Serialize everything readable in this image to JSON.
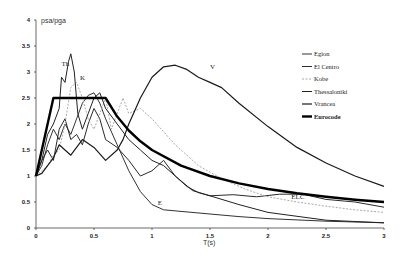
{
  "chart_data": {
    "type": "line",
    "title": "",
    "xlabel": "T(s)",
    "ylabel": "psa/pga",
    "xlim": [
      0,
      3
    ],
    "ylim": [
      0,
      4
    ],
    "x_ticks": [
      "0",
      "0.5",
      "1",
      "1.5",
      "2",
      "2.5",
      "3"
    ],
    "y_ticks": [
      "0",
      "0.5",
      "1",
      "1.5",
      "2",
      "2.5",
      "3",
      "3.5",
      "4"
    ],
    "grid": false,
    "legend_position": "upper right",
    "series": [
      {
        "name": "Egion",
        "label": "E",
        "color": "#333333",
        "width": 1,
        "dash": "",
        "points": [
          [
            0,
            1
          ],
          [
            0.05,
            1.2
          ],
          [
            0.1,
            1.6
          ],
          [
            0.15,
            1.9
          ],
          [
            0.2,
            1.7
          ],
          [
            0.25,
            2.0
          ],
          [
            0.3,
            1.8
          ],
          [
            0.35,
            2.1
          ],
          [
            0.4,
            2.4
          ],
          [
            0.45,
            2.55
          ],
          [
            0.5,
            2.6
          ],
          [
            0.55,
            2.4
          ],
          [
            0.6,
            2.1
          ],
          [
            0.7,
            1.6
          ],
          [
            0.8,
            1.1
          ],
          [
            0.9,
            0.7
          ],
          [
            1.0,
            0.45
          ],
          [
            1.1,
            0.35
          ],
          [
            1.25,
            0.32
          ],
          [
            1.5,
            0.27
          ],
          [
            1.75,
            0.22
          ],
          [
            2.0,
            0.18
          ],
          [
            2.5,
            0.13
          ],
          [
            3.0,
            0.1
          ]
        ]
      },
      {
        "name": "El Centro",
        "label": "ELC",
        "color": "#2a2a2a",
        "width": 1,
        "dash": "",
        "points": [
          [
            0,
            1
          ],
          [
            0.05,
            1.3
          ],
          [
            0.1,
            1.5
          ],
          [
            0.15,
            1.3
          ],
          [
            0.2,
            1.9
          ],
          [
            0.25,
            2.1
          ],
          [
            0.3,
            1.7
          ],
          [
            0.35,
            1.8
          ],
          [
            0.4,
            1.6
          ],
          [
            0.45,
            2.0
          ],
          [
            0.5,
            2.3
          ],
          [
            0.55,
            2.1
          ],
          [
            0.6,
            1.7
          ],
          [
            0.7,
            1.55
          ],
          [
            0.8,
            1.3
          ],
          [
            0.9,
            1.0
          ],
          [
            1.0,
            1.1
          ],
          [
            1.1,
            1.3
          ],
          [
            1.2,
            1.0
          ],
          [
            1.3,
            0.8
          ],
          [
            1.4,
            0.68
          ],
          [
            1.5,
            0.62
          ],
          [
            1.7,
            0.64
          ],
          [
            1.9,
            0.6
          ],
          [
            2.1,
            0.65
          ],
          [
            2.3,
            0.65
          ],
          [
            2.5,
            0.55
          ],
          [
            2.75,
            0.5
          ],
          [
            3.0,
            0.4
          ]
        ]
      },
      {
        "name": "Kobe",
        "label": "K",
        "color": "#aaaaaa",
        "width": 1,
        "dash": "2,1.5",
        "points": [
          [
            0,
            1
          ],
          [
            0.05,
            1.1
          ],
          [
            0.1,
            1.2
          ],
          [
            0.15,
            1.4
          ],
          [
            0.2,
            1.5
          ],
          [
            0.25,
            2.0
          ],
          [
            0.3,
            2.7
          ],
          [
            0.35,
            2.8
          ],
          [
            0.4,
            2.5
          ],
          [
            0.45,
            2.1
          ],
          [
            0.5,
            1.9
          ],
          [
            0.55,
            2.2
          ],
          [
            0.6,
            2.5
          ],
          [
            0.65,
            1.9
          ],
          [
            0.7,
            2.2
          ],
          [
            0.75,
            2.5
          ],
          [
            0.8,
            2.2
          ],
          [
            0.9,
            2.3
          ],
          [
            1.0,
            2.1
          ],
          [
            1.2,
            1.6
          ],
          [
            1.4,
            1.2
          ],
          [
            1.6,
            0.95
          ],
          [
            1.8,
            0.75
          ],
          [
            2.0,
            0.6
          ],
          [
            2.25,
            0.5
          ],
          [
            2.5,
            0.42
          ],
          [
            2.75,
            0.35
          ],
          [
            3.0,
            0.3
          ]
        ]
      },
      {
        "name": "Thessaloniki",
        "label": "Th",
        "color": "#222222",
        "width": 1,
        "dash": "",
        "points": [
          [
            0,
            1
          ],
          [
            0.05,
            1.3
          ],
          [
            0.1,
            1.8
          ],
          [
            0.15,
            2.0
          ],
          [
            0.2,
            2.3
          ],
          [
            0.22,
            2.9
          ],
          [
            0.25,
            2.8
          ],
          [
            0.28,
            3.2
          ],
          [
            0.3,
            3.35
          ],
          [
            0.33,
            3.0
          ],
          [
            0.36,
            2.2
          ],
          [
            0.4,
            1.9
          ],
          [
            0.45,
            2.2
          ],
          [
            0.5,
            2.5
          ],
          [
            0.55,
            2.6
          ],
          [
            0.6,
            2.3
          ],
          [
            0.7,
            2.0
          ],
          [
            0.8,
            1.7
          ],
          [
            0.9,
            1.5
          ],
          [
            1.0,
            1.3
          ],
          [
            1.1,
            1.2
          ],
          [
            1.2,
            1.0
          ],
          [
            1.35,
            0.72
          ],
          [
            1.5,
            0.62
          ],
          [
            1.75,
            0.45
          ],
          [
            2.0,
            0.3
          ],
          [
            2.5,
            0.15
          ],
          [
            3.0,
            0.1
          ]
        ]
      },
      {
        "name": "Vrancea",
        "label": "V",
        "color": "#1a1a1a",
        "width": 1.2,
        "dash": "",
        "points": [
          [
            0,
            1
          ],
          [
            0.05,
            1.05
          ],
          [
            0.1,
            1.2
          ],
          [
            0.15,
            1.35
          ],
          [
            0.2,
            1.6
          ],
          [
            0.3,
            1.4
          ],
          [
            0.4,
            1.7
          ],
          [
            0.5,
            1.55
          ],
          [
            0.6,
            1.3
          ],
          [
            0.7,
            1.5
          ],
          [
            0.75,
            1.7
          ],
          [
            0.8,
            2.0
          ],
          [
            0.9,
            2.5
          ],
          [
            1.0,
            2.9
          ],
          [
            1.1,
            3.1
          ],
          [
            1.2,
            3.13
          ],
          [
            1.3,
            3.05
          ],
          [
            1.4,
            2.9
          ],
          [
            1.5,
            2.8
          ],
          [
            1.6,
            2.7
          ],
          [
            1.75,
            2.4
          ],
          [
            2.0,
            1.95
          ],
          [
            2.25,
            1.55
          ],
          [
            2.5,
            1.25
          ],
          [
            2.75,
            1.0
          ],
          [
            3.0,
            0.8
          ]
        ]
      },
      {
        "name": "Eurocode",
        "label": "",
        "color": "#000000",
        "width": 2.4,
        "dash": "",
        "points": [
          [
            0,
            1
          ],
          [
            0.15,
            2.5
          ],
          [
            0.6,
            2.5
          ],
          [
            0.7,
            2.143
          ],
          [
            0.8,
            1.875
          ],
          [
            0.9,
            1.667
          ],
          [
            1.0,
            1.5
          ],
          [
            1.25,
            1.2
          ],
          [
            1.5,
            1.0
          ],
          [
            1.75,
            0.857
          ],
          [
            2.0,
            0.75
          ],
          [
            2.25,
            0.667
          ],
          [
            2.5,
            0.6
          ],
          [
            2.75,
            0.545
          ],
          [
            3.0,
            0.5
          ]
        ]
      }
    ],
    "annotations": [
      {
        "text": "Th",
        "x": 0.22,
        "y": 3.12
      },
      {
        "text": "K",
        "x": 0.38,
        "y": 2.85
      },
      {
        "text": "V",
        "x": 1.5,
        "y": 3.05
      },
      {
        "text": "E",
        "x": 1.05,
        "y": 0.45
      },
      {
        "text": "ELC",
        "x": 2.2,
        "y": 0.55
      }
    ]
  },
  "axes": {
    "ylabel": "psa/pga",
    "xlabel": "T(s)"
  },
  "legend": {
    "items": [
      {
        "label": "Egion"
      },
      {
        "label": "El Centro"
      },
      {
        "label": "Kobe"
      },
      {
        "label": "Thessaloniki"
      },
      {
        "label": "Vrancea"
      },
      {
        "label": "Eurocode"
      }
    ]
  }
}
